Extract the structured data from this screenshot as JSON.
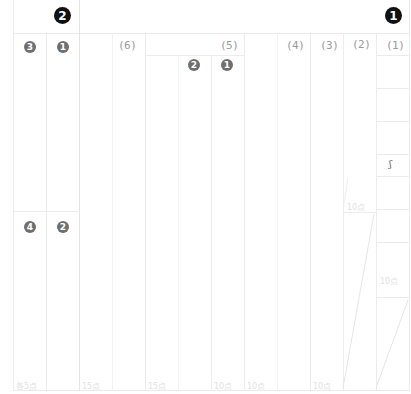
{
  "sheet": {
    "sections": [
      {
        "id": "section-1",
        "marker": "1",
        "marker_style": "black-circle"
      },
      {
        "id": "section-2",
        "marker": "2",
        "marker_style": "black-circle"
      }
    ],
    "section_1_questions": [
      {
        "label": "(1)",
        "score": "10点"
      },
      {
        "label": "(2)",
        "score": "10点"
      },
      {
        "label": "(3)",
        "score": "10点"
      },
      {
        "label": "(4)",
        "score": "10点"
      },
      {
        "label": "(5)",
        "score": "10点",
        "sub_items": [
          "1",
          "2"
        ]
      },
      {
        "label": "(6)",
        "score": "15点"
      }
    ],
    "section_1_extra_score": "15点",
    "section_2_items": [
      {
        "marker": "1"
      },
      {
        "marker": "2"
      },
      {
        "marker": "3"
      },
      {
        "marker": "4"
      }
    ],
    "section_2_score": "各5点",
    "col1_glyph": "ʃ",
    "col1_mid_score": "10点"
  }
}
